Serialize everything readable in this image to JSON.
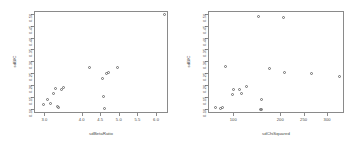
{
  "figure": {
    "background": "#ffffff",
    "point_color": "#6e6e6e",
    "axis_color": "#8a8a8a",
    "text_color": "#4a4a4a"
  },
  "chart_data": [
    {
      "type": "scatter",
      "panel": "left",
      "title": "",
      "xlabel": "sdBetaRatio",
      "ylabel": "sdBIC",
      "xlim": [
        2.72,
        6.32
      ],
      "ylim": [
        0.082,
        0.512
      ],
      "xticks": [
        3.0,
        4.0,
        4.5,
        5.0,
        5.5,
        6.0
      ],
      "xticklabels": [
        "3.0",
        "4.0",
        "4.5",
        "5.0",
        "5.5",
        "6.0"
      ],
      "yticks": [
        0.1,
        0.15,
        0.2,
        0.25,
        0.3,
        0.35,
        0.4,
        0.45,
        0.5
      ],
      "yticklabels": [
        "0.10",
        "0.15",
        "0.20",
        "0.25",
        "0.30",
        "0.35",
        "0.40",
        "0.45",
        "0.50"
      ],
      "grid": false,
      "legend": "none",
      "x": [
        6.2,
        4.18,
        4.93,
        4.69,
        4.64,
        4.52,
        3.49,
        3.28,
        3.44,
        3.22,
        3.05,
        3.13,
        2.96,
        3.32,
        3.36,
        4.56,
        4.59
      ],
      "y": [
        0.5,
        0.278,
        0.276,
        0.258,
        0.252,
        0.231,
        0.192,
        0.189,
        0.186,
        0.168,
        0.143,
        0.126,
        0.12,
        0.112,
        0.11,
        0.157,
        0.104
      ]
    },
    {
      "type": "scatter",
      "panel": "right",
      "title": "",
      "xlabel": "sdChiSquared",
      "ylabel": "sdBIC",
      "xlim": [
        46,
        336
      ],
      "ylim": [
        0.082,
        0.512
      ],
      "xticks": [
        100,
        200,
        250,
        300
      ],
      "xticklabels": [
        "100",
        "200",
        "250",
        "300"
      ],
      "yticks": [
        0.1,
        0.15,
        0.2,
        0.25,
        0.3,
        0.35,
        0.4,
        0.45,
        0.5
      ],
      "yticklabels": [
        "0.10",
        "0.15",
        "0.20",
        "0.25",
        "0.30",
        "0.35",
        "0.40",
        "0.45",
        "0.50"
      ],
      "grid": false,
      "legend": "none",
      "x": [
        152,
        205,
        81,
        175,
        207,
        265,
        325,
        98,
        112,
        127,
        96,
        115,
        158,
        60,
        71,
        74,
        157,
        155
      ],
      "y": [
        0.492,
        0.49,
        0.283,
        0.273,
        0.258,
        0.252,
        0.238,
        0.186,
        0.184,
        0.196,
        0.166,
        0.168,
        0.144,
        0.11,
        0.104,
        0.108,
        0.1,
        0.1
      ]
    }
  ]
}
